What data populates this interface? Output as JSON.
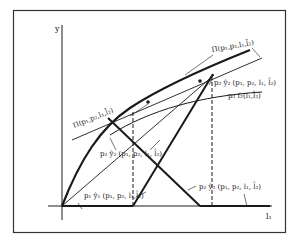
{
  "diagram": {
    "axes": {
      "y_label": "y",
      "x_label": "l₁"
    },
    "curves": {
      "pi_top": "Π(p₁,p₂,l₁,l̄₂)",
      "pi_left": "Π(p₁,p₂,l₁,l̄₂)",
      "p2f2": "p₂ f₂(l₁,l̄₂)",
      "p2y2_top": "p₂ ŷ₂ (p₁, p₂, l₁, l̄₂)",
      "p2y2_mid": "p₂ ŷ₂ (p₁, p₂, l₁, l̄₂)",
      "p1y1": "p₁ ŷ₁ (p₁, p₂, l₁,l̄₂)",
      "p2y2_bottom": "p₂ ŷ₂ (p₁, p₂, l₁, l̄₂)"
    },
    "colors": {
      "ink": "#1a1a1a",
      "background": "#ffffff",
      "frame": "#333333"
    }
  }
}
